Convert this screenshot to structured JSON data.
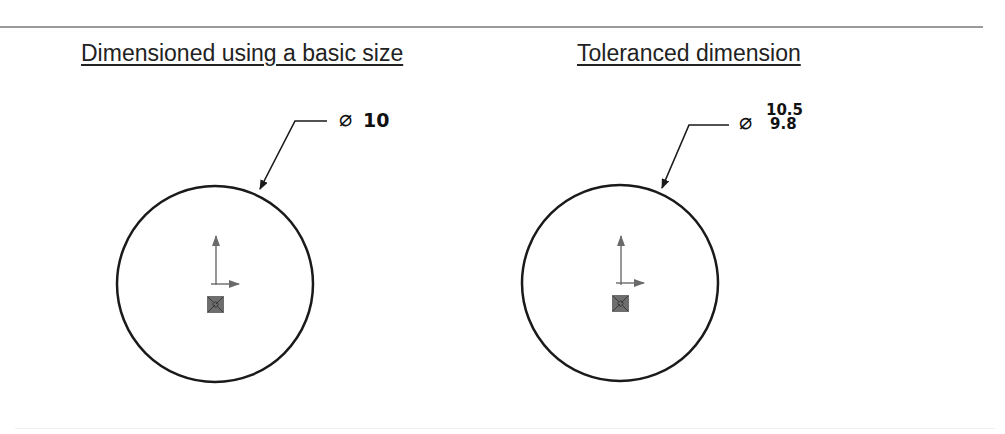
{
  "panels": [
    {
      "heading": "Dimensioned using a basic size",
      "diameter_symbol": "⌀",
      "dimension_value": "10"
    },
    {
      "heading": "Toleranced dimension",
      "diameter_symbol": "⌀",
      "upper_limit": "10.5",
      "lower_limit": "9.8"
    }
  ],
  "colors": {
    "line": "#1a1a1a",
    "origin_marker": "#6a6a6a",
    "rule": "#9a9a9a"
  }
}
